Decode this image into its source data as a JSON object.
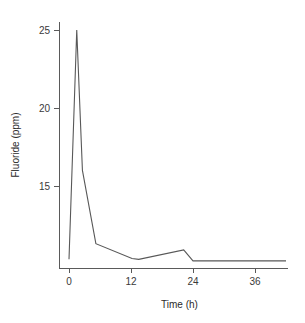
{
  "chart_data": {
    "type": "line",
    "title": "",
    "xlabel": "Time (h)",
    "ylabel": "Fluoride (ppm)",
    "xlim": [
      -1.5,
      45.5
    ],
    "ylim": [
      9.6,
      26.2
    ],
    "xticks": [
      0,
      12,
      24,
      36
    ],
    "xtick_labels": [
      "0",
      "12",
      "24",
      "36"
    ],
    "yticks": [
      15,
      20,
      25
    ],
    "ytick_labels": [
      "15",
      "20",
      "25"
    ],
    "grid": false,
    "legend": "none",
    "line_color": "#585858",
    "axis_color": "#5a5a5a",
    "background": "#ffffff",
    "series": [
      {
        "name": "Fluoride concentration",
        "x": [
          0,
          1.5,
          2.6,
          5.2,
          12.2,
          13.5,
          22.2,
          24.0,
          42.0
        ],
        "values": [
          10.3,
          25.0,
          16.0,
          11.3,
          10.35,
          10.3,
          10.9,
          10.2,
          10.2
        ]
      }
    ]
  }
}
